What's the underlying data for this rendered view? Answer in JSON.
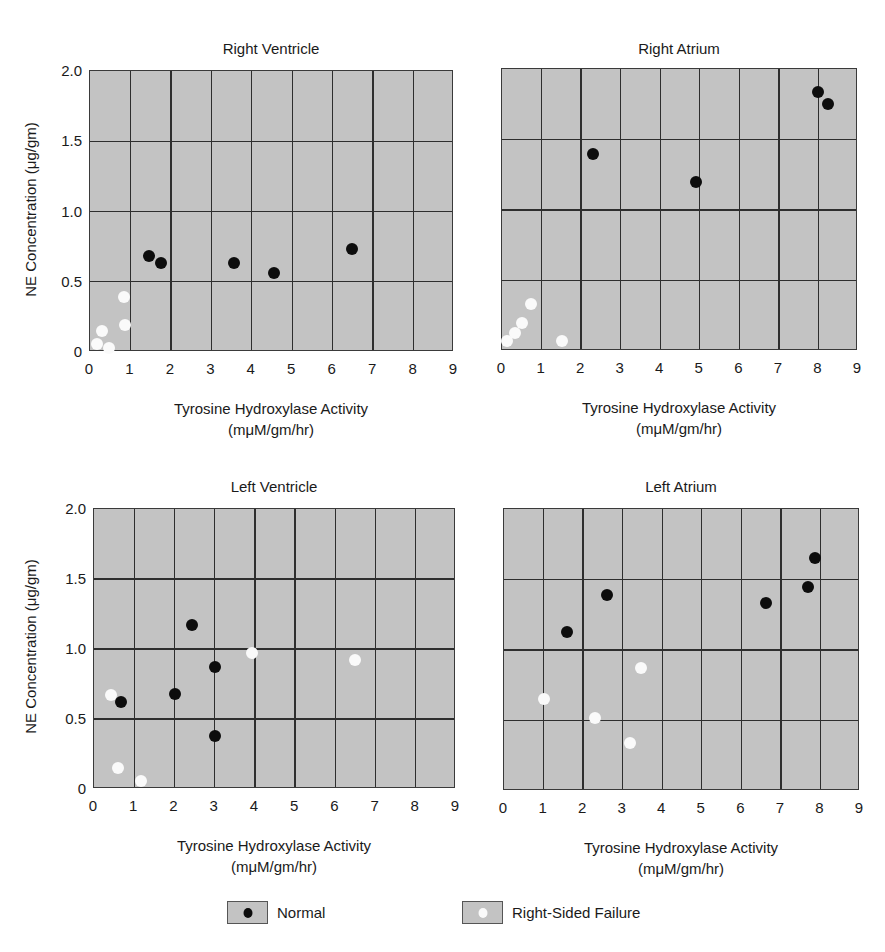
{
  "chart_data": [
    {
      "type": "scatter",
      "title": "Right Ventricle",
      "xlabel": "Tyrosine Hydroxylase Activity (mμM/gm/hr)",
      "ylabel": "NE Concentration (μg/gm)",
      "xlim": [
        0,
        9
      ],
      "ylim": [
        0,
        2.0
      ],
      "grid": true,
      "series": [
        {
          "name": "Normal",
          "points": [
            [
              1.46,
              0.68
            ],
            [
              1.76,
              0.63
            ],
            [
              3.57,
              0.63
            ],
            [
              4.54,
              0.56
            ],
            [
              6.48,
              0.73
            ]
          ]
        },
        {
          "name": "Right-Sided Failure",
          "points": [
            [
              0.84,
              0.39
            ],
            [
              0.87,
              0.19
            ],
            [
              0.3,
              0.15
            ],
            [
              0.17,
              0.06
            ],
            [
              0.47,
              0.03
            ]
          ]
        }
      ]
    },
    {
      "type": "scatter",
      "title": "Right Atrium",
      "xlabel": "Tyrosine Hydroxylase Activity (mμM/gm/hr)",
      "ylabel": "",
      "xlim": [
        0,
        9
      ],
      "ylim": [
        0,
        2.0
      ],
      "grid": true,
      "series": [
        {
          "name": "Normal",
          "points": [
            [
              2.3,
              1.4
            ],
            [
              4.9,
              1.2
            ],
            [
              7.98,
              1.84
            ],
            [
              8.23,
              1.75
            ]
          ]
        },
        {
          "name": "Right-Sided Failure",
          "points": [
            [
              0.73,
              0.33
            ],
            [
              0.5,
              0.2
            ],
            [
              0.33,
              0.13
            ],
            [
              0.12,
              0.07
            ],
            [
              1.52,
              0.07
            ]
          ]
        }
      ]
    },
    {
      "type": "scatter",
      "title": "Left Ventricle",
      "xlabel": "Tyrosine Hydroxylase Activity (mμM/gm/hr)",
      "ylabel": "NE Concentration (μg/gm)",
      "xlim": [
        0,
        9
      ],
      "ylim": [
        0,
        2.0
      ],
      "grid": true,
      "series": [
        {
          "name": "Normal",
          "points": [
            [
              2.43,
              1.17
            ],
            [
              3.0,
              0.87
            ],
            [
              2.01,
              0.68
            ],
            [
              0.67,
              0.62
            ],
            [
              3.0,
              0.38
            ]
          ]
        },
        {
          "name": "Right-Sided Failure",
          "points": [
            [
              0.42,
              0.67
            ],
            [
              0.6,
              0.15
            ],
            [
              1.17,
              0.06
            ],
            [
              3.92,
              0.97
            ],
            [
              6.5,
              0.92
            ]
          ]
        }
      ]
    },
    {
      "type": "scatter",
      "title": "Left Atrium",
      "xlabel": "Tyrosine Hydroxylase Activity (mμM/gm/hr)",
      "ylabel": "",
      "xlim": [
        0,
        9
      ],
      "ylim": [
        0,
        2.0
      ],
      "grid": true,
      "series": [
        {
          "name": "Normal",
          "points": [
            [
              1.59,
              1.13
            ],
            [
              2.6,
              1.39
            ],
            [
              6.62,
              1.33
            ],
            [
              7.68,
              1.45
            ],
            [
              7.85,
              1.65
            ]
          ]
        },
        {
          "name": "Right-Sided Failure",
          "points": [
            [
              1.01,
              0.65
            ],
            [
              2.3,
              0.52
            ],
            [
              3.18,
              0.34
            ],
            [
              3.46,
              0.87
            ]
          ]
        }
      ]
    }
  ],
  "axes": {
    "x_ticks": [
      "0",
      "1",
      "2",
      "3",
      "4",
      "5",
      "6",
      "7",
      "8",
      "9"
    ],
    "y_ticks": [
      "0",
      "0.5",
      "1.0",
      "1.5",
      "2.0"
    ],
    "xlabel_line1": "Tyrosine Hydroxylase Activity",
    "xlabel_line2": "(mμM/gm/hr)",
    "ylabel": "NE Concentration (μg/gm)"
  },
  "legend": {
    "position": "bottom",
    "items": [
      {
        "label": "Normal",
        "dot_color": "#0d0d0d"
      },
      {
        "label": "Right-Sided Failure",
        "dot_color": "#fafafa"
      }
    ]
  },
  "colors": {
    "plot_bg": "#c3c3c3",
    "grid": "#2e2e2e",
    "normal": "#0d0d0d",
    "failure": "#fafafa"
  }
}
